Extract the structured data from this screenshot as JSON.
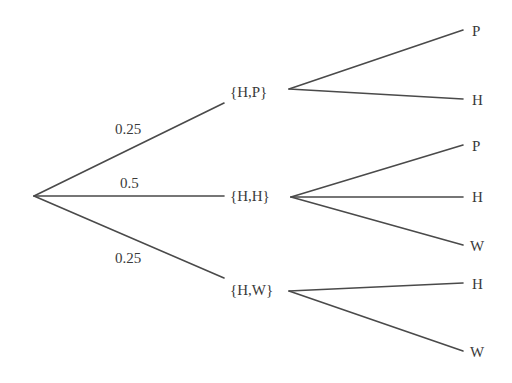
{
  "diagram": {
    "type": "probability-tree",
    "colors": {
      "line": "#4a4a4a",
      "text": "#3a3a3a",
      "background": "#ffffff"
    },
    "root": {
      "x": 34,
      "y": 196
    },
    "level1": [
      {
        "id": "hp",
        "label": "{H,P}",
        "probability": "0.25",
        "anchor": {
          "x": 224,
          "y": 103
        },
        "label_pos": {
          "x": 230,
          "y": 97
        },
        "prob_pos": {
          "x": 115,
          "y": 134
        },
        "out": {
          "x": 289,
          "y": 89
        }
      },
      {
        "id": "hh",
        "label": "{H,H}",
        "probability": "0.5",
        "anchor": {
          "x": 224,
          "y": 196
        },
        "label_pos": {
          "x": 230,
          "y": 201
        },
        "prob_pos": {
          "x": 120,
          "y": 188
        },
        "out": {
          "x": 291,
          "y": 197
        }
      },
      {
        "id": "hw",
        "label": "{H,W}",
        "probability": "0.25",
        "anchor": {
          "x": 224,
          "y": 278
        },
        "label_pos": {
          "x": 230,
          "y": 295
        },
        "prob_pos": {
          "x": 115,
          "y": 263
        },
        "out": {
          "x": 289,
          "y": 291
        }
      }
    ],
    "level2": [
      {
        "parent": "hp",
        "label": "P",
        "end": {
          "x": 463,
          "y": 30
        },
        "label_pos": {
          "x": 472,
          "y": 36
        }
      },
      {
        "parent": "hp",
        "label": "H",
        "end": {
          "x": 463,
          "y": 99
        },
        "label_pos": {
          "x": 472,
          "y": 105
        }
      },
      {
        "parent": "hh",
        "label": "P",
        "end": {
          "x": 463,
          "y": 145
        },
        "label_pos": {
          "x": 472,
          "y": 151
        }
      },
      {
        "parent": "hh",
        "label": "H",
        "end": {
          "x": 463,
          "y": 197
        },
        "label_pos": {
          "x": 472,
          "y": 202
        }
      },
      {
        "parent": "hh",
        "label": "W",
        "end": {
          "x": 463,
          "y": 245
        },
        "label_pos": {
          "x": 470,
          "y": 251
        }
      },
      {
        "parent": "hw",
        "label": "H",
        "end": {
          "x": 463,
          "y": 283
        },
        "label_pos": {
          "x": 472,
          "y": 289
        }
      },
      {
        "parent": "hw",
        "label": "W",
        "end": {
          "x": 463,
          "y": 351
        },
        "label_pos": {
          "x": 470,
          "y": 357
        }
      }
    ]
  }
}
